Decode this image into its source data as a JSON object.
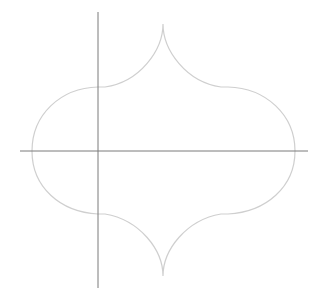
{
  "diagram": {
    "colors": {
      "background": "#ffffff",
      "shape_stroke": "#cfcfcf",
      "axis_stroke": "#7a7a7a"
    },
    "axes": {
      "vertical": {
        "x": 98,
        "y1": 12,
        "y2": 288
      },
      "horizontal": {
        "y": 151,
        "x1": 20,
        "x2": 308
      }
    },
    "shape": {
      "top_cusp": [
        163,
        24
      ],
      "bottom_cusp": [
        163,
        276
      ],
      "left_extreme": [
        32,
        151
      ],
      "right_extreme": [
        295,
        151
      ],
      "shoulder_top_y": 87,
      "shoulder_bottom_y": 213
    }
  }
}
